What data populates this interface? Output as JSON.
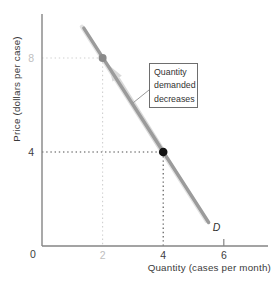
{
  "chart_data": {
    "type": "line",
    "title": "",
    "xlabel": "Quantity (cases per month)",
    "ylabel": "Price (dollars per case)",
    "xlim": [
      0,
      7.5
    ],
    "ylim": [
      0,
      9.9
    ],
    "grid": false,
    "x_ticks": [
      {
        "value": 0,
        "label": "0",
        "muted": false,
        "tick_mark": false
      },
      {
        "value": 2,
        "label": "2",
        "muted": true,
        "tick_mark": false
      },
      {
        "value": 4,
        "label": "4",
        "muted": false,
        "tick_mark": false
      },
      {
        "value": 6,
        "label": "6",
        "muted": false,
        "tick_mark": true
      }
    ],
    "y_ticks": [
      {
        "value": 4,
        "label": "4",
        "muted": false
      },
      {
        "value": 8,
        "label": "8",
        "muted": true
      }
    ],
    "series": [
      {
        "name": "demand",
        "label": "D",
        "points": [
          [
            1.38,
            9.27
          ],
          [
            5.5,
            1.0
          ]
        ]
      }
    ],
    "markers": [
      {
        "x": 2,
        "y": 8,
        "style": "gray"
      },
      {
        "x": 4,
        "y": 4,
        "style": "black"
      }
    ],
    "movement_arrow": {
      "from_xy": [
        4,
        4
      ],
      "to_xy": [
        2.2,
        7.7
      ]
    },
    "annotation": {
      "text": "Quantity\ndemanded\ndecreases"
    }
  },
  "colors": {
    "background": "#ffffff",
    "curve": "#9b9b9b",
    "curve_glow": "#e3e3e3",
    "axis": "#858585",
    "tick_dark": "#3d3d3d",
    "tick_muted": "#c0c0c0",
    "marker_gray": "#8a8a8a",
    "marker_black": "#141414",
    "guide_gray": "#cfcfcf",
    "guide_dark": "#4d4d4d",
    "arrow": "#d9d9d9",
    "leader": "#9a9a9a",
    "label_text": "#2f2f2f"
  }
}
